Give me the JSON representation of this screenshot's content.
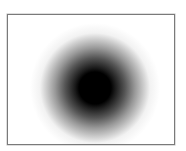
{
  "image": {
    "subject": "gaussian-blob",
    "frame_border_color": "#7a7a7a",
    "background_color": "#ffffff",
    "blob": {
      "center_x": 87,
      "center_y": 73,
      "core_color": "#000000",
      "core_radius": 20,
      "fade_radius": 60
    }
  }
}
